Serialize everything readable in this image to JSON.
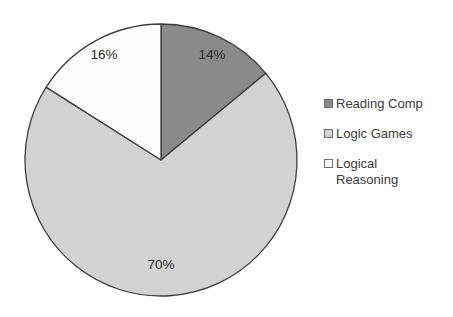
{
  "chart_data": {
    "type": "pie",
    "title": "",
    "categories": [
      "Reading Comp",
      "Logic Games",
      "Logical Reasoning"
    ],
    "values": [
      14,
      70,
      16
    ],
    "value_unit": "%",
    "data_labels": [
      "14%",
      "70%",
      "16%"
    ],
    "colors": [
      "#8a8a8a",
      "#d2d2d2",
      "#fbfbfb"
    ],
    "slice_outline_color": "#3d3d3d",
    "start_angle_deg": 0,
    "direction": "clockwise",
    "legend_position": "right",
    "grid": false,
    "xlabel": "",
    "ylabel": ""
  },
  "legend": {
    "items": [
      {
        "label": "Reading Comp",
        "swatch_color": "#8a8a8a",
        "swatch_name": "legend-swatch-reading-comp"
      },
      {
        "label": "Logic Games",
        "swatch_color": "#d2d2d2",
        "swatch_name": "legend-swatch-logic-games"
      },
      {
        "label": "Logical\nReasoning",
        "swatch_color": "#fbfbfb",
        "swatch_name": "legend-swatch-logical-reasoning"
      }
    ]
  },
  "pie": {
    "center_x": 161,
    "center_y": 160,
    "radius": 136,
    "labels": [
      {
        "text": "14%",
        "x": 212,
        "y": 55
      },
      {
        "text": "70%",
        "x": 161,
        "y": 265
      },
      {
        "text": "16%",
        "x": 104,
        "y": 55
      }
    ]
  }
}
